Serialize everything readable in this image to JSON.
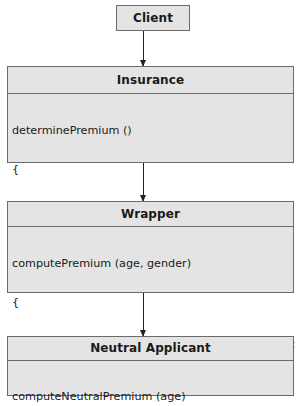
{
  "diagram": {
    "client": {
      "title": "Client"
    },
    "arrows": [
      {
        "from": "Client",
        "to": "Insurance"
      },
      {
        "from": "Insurance",
        "to": "Wrapper"
      },
      {
        "from": "Wrapper",
        "to": "Neutral Applicant"
      }
    ],
    "insurance": {
      "title": "Insurance",
      "lines": [
        "determinePremium ()",
        "{",
        "wrapper.computePremium (age, gender);",
        "}"
      ]
    },
    "wrapper": {
      "title": "Wrapper",
      "lines": [
        "computePremium (age, gender)",
        "{",
        "neutralApplicant.computeNeutralPremium (age);",
        "}"
      ]
    },
    "neutral_applicant": {
      "title": "Neutral Applicant",
      "lines": [
        "computeNeutralPremium (age)"
      ]
    },
    "colors": {
      "box_fill": "#e4e4e4",
      "border": "#6a6a6a",
      "arrow": "#222222"
    }
  }
}
